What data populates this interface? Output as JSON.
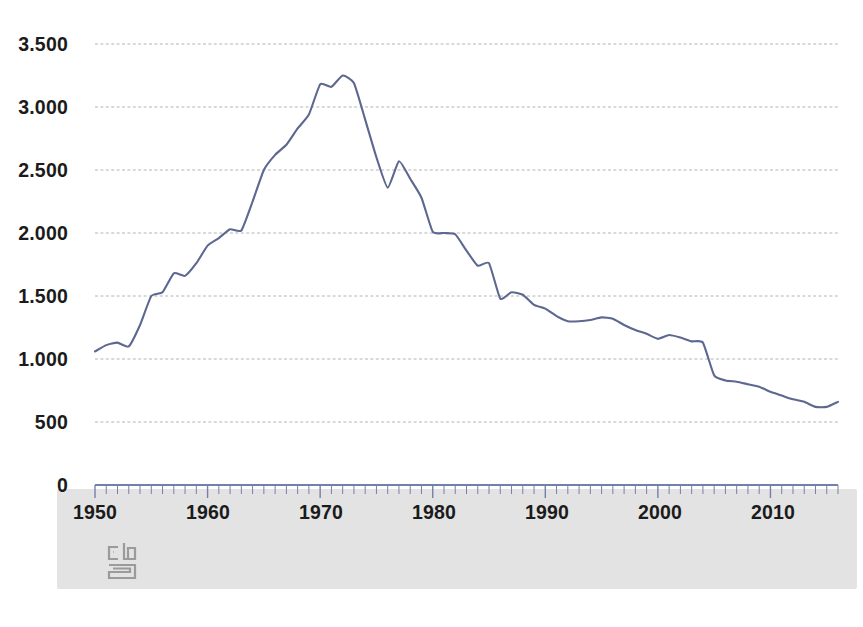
{
  "chart_data": {
    "type": "line",
    "title": "",
    "subtitle": "",
    "xlabel": "",
    "ylabel": "",
    "xlim": [
      1950,
      2016
    ],
    "ylim": [
      0,
      3500
    ],
    "grid": true,
    "legend": false,
    "line_color": "#5d6790",
    "grid_color": "#b4b4b4",
    "axis_color": "#7580a8",
    "y_ticks": [
      0,
      500,
      1000,
      1500,
      2000,
      2500,
      3000,
      3500
    ],
    "y_tick_labels": [
      "0",
      "500",
      "1.000",
      "1.500",
      "2.000",
      "2.500",
      "3.000",
      "3.500"
    ],
    "x_ticks": [
      1950,
      1960,
      1970,
      1980,
      1990,
      2000,
      2010
    ],
    "x_tick_labels": [
      "1950",
      "1960",
      "1970",
      "1980",
      "1990",
      "2000",
      "2010"
    ],
    "x_minor_tick_step": 1,
    "series": [
      {
        "name": "series-1",
        "x": [
          1950,
          1951,
          1952,
          1953,
          1954,
          1955,
          1956,
          1957,
          1958,
          1959,
          1960,
          1961,
          1962,
          1963,
          1964,
          1965,
          1966,
          1967,
          1968,
          1969,
          1970,
          1971,
          1972,
          1973,
          1974,
          1975,
          1976,
          1977,
          1978,
          1979,
          1980,
          1981,
          1982,
          1983,
          1984,
          1985,
          1986,
          1987,
          1988,
          1989,
          1990,
          1991,
          1992,
          1993,
          1994,
          1995,
          1996,
          1997,
          1998,
          1999,
          2000,
          2001,
          2002,
          2003,
          2004,
          2005,
          2006,
          2007,
          2008,
          2009,
          2010,
          2011,
          2012,
          2013,
          2014,
          2015,
          2016
        ],
        "values": [
          1060,
          1110,
          1130,
          1100,
          1270,
          1500,
          1530,
          1680,
          1660,
          1760,
          1900,
          1960,
          2030,
          2020,
          2250,
          2500,
          2620,
          2700,
          2830,
          2940,
          3180,
          3160,
          3250,
          3190,
          2900,
          2600,
          2360,
          2570,
          2430,
          2280,
          2010,
          2000,
          1990,
          1860,
          1740,
          1760,
          1480,
          1530,
          1510,
          1430,
          1400,
          1340,
          1300,
          1300,
          1310,
          1330,
          1320,
          1270,
          1230,
          1200,
          1160,
          1190,
          1170,
          1140,
          1130,
          870,
          830,
          820,
          800,
          780,
          740,
          710,
          680,
          660,
          620,
          620,
          660
        ]
      }
    ],
    "annotations": {
      "peak_year": 1972,
      "peak_value": 3250,
      "start_value": 1060,
      "end_value": 660
    }
  },
  "branding": {
    "logo_name": "cbs-logo",
    "logo_alt": "CBS"
  }
}
